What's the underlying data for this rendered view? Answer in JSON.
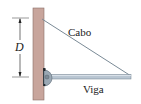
{
  "diagram": {
    "labels": {
      "cable": "Cabo",
      "beam": "Viga",
      "dimension": "D"
    },
    "colors": {
      "wall": "#c8a59c",
      "wall_border": "#8a6e68",
      "cable": "#7a8a96",
      "beam_fill": "#b9c6d2",
      "beam_edge": "#6e7f8c",
      "pin": "#9aa8b4",
      "dimension_line": "#333333"
    }
  }
}
